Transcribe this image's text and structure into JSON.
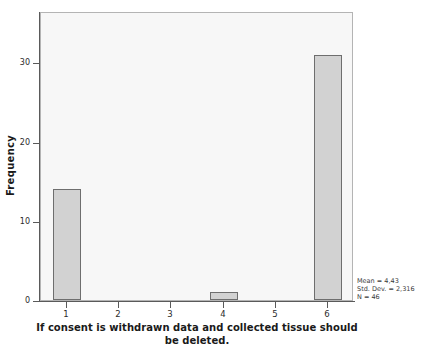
{
  "chart_data": {
    "type": "bar",
    "title": "",
    "categories": [
      "1",
      "2",
      "3",
      "4",
      "5",
      "6"
    ],
    "values": [
      14,
      0,
      0,
      1,
      0,
      31
    ],
    "series": [
      {
        "name": "Frequency",
        "values": [
          14,
          0,
          0,
          1,
          0,
          31
        ]
      }
    ],
    "xlabel": "If consent is withdrawn data and collected tissue should be deleted.",
    "ylabel": "Frequency",
    "ylim": [
      0,
      36.5
    ],
    "y_ticks": [
      "0",
      "10",
      "20",
      "30"
    ],
    "y_tick_values": [
      0,
      10,
      20,
      30
    ],
    "x_ticks": [
      "1",
      "2",
      "3",
      "4",
      "5",
      "6"
    ],
    "grid": false,
    "legend": "none",
    "annotations": [
      "Mean = 4,43",
      "Std. Dev. = 2,316",
      "N = 46"
    ],
    "colors": {
      "bar_fill": "#d2d2d2",
      "bar_stroke": "#6e6e6e",
      "plot_background": "#f7f7f7",
      "frame_border": "#b4b4b4",
      "axis": "#5a5a5a",
      "text": "#1a1a1a"
    }
  },
  "statistics": {
    "mean_label": "Mean = 4,43",
    "std_dev_label": "Std. Dev. = 2,316",
    "n_label": "N = 46"
  },
  "axes": {
    "y_title": "Frequency",
    "x_title_line1": "If consent is withdrawn data and collected tissue should",
    "x_title_line2": "be deleted."
  }
}
